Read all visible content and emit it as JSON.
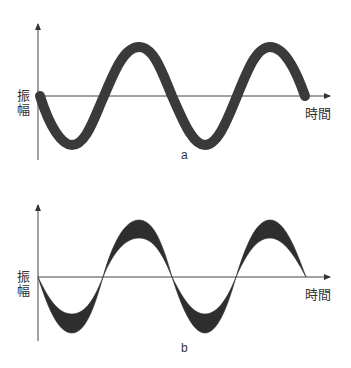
{
  "diagrams": [
    {
      "id": "a",
      "caption": "a",
      "y_label_line1": "振",
      "y_label_line2": "幅",
      "x_label": "時間",
      "wave_style": "thick-stroke",
      "wave_color": "#3a3a3a"
    },
    {
      "id": "b",
      "caption": "b",
      "y_label_line1": "振",
      "y_label_line2": "幅",
      "x_label": "時間",
      "wave_style": "filled-crescent",
      "wave_color": "#2e2e2e"
    }
  ],
  "colors": {
    "axis": "#444444",
    "text": "#333333",
    "background": "#ffffff"
  }
}
